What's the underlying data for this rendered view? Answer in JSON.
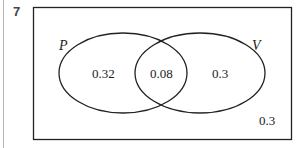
{
  "question": {
    "number": "7"
  },
  "diagram": {
    "type": "venn",
    "sets": [
      {
        "name": "P",
        "only_value": "0.32"
      },
      {
        "name": "V",
        "only_value": "0.3"
      }
    ],
    "intersection_value": "0.08",
    "outside_value": "0.3",
    "colors": {
      "stroke": "#222222",
      "background": "#ffffff"
    }
  }
}
